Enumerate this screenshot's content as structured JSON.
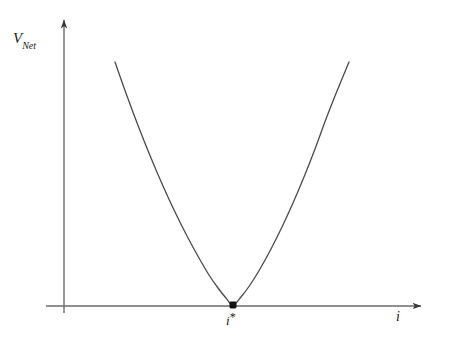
{
  "figure": {
    "background_color": "#ffffff",
    "ink_color": "#3a3a3a",
    "text_color": "#1a1a1a"
  },
  "labels": {
    "y_axis_main": "V",
    "y_axis_subscript": "Net",
    "x_axis": "i",
    "vertex_base": "i",
    "vertex_superscript": "*"
  },
  "chart_data": {
    "type": "line",
    "title": "",
    "xlabel": "i",
    "ylabel": "V_Net",
    "grid": false,
    "legend": null,
    "annotations": [
      {
        "name": "minimum-point",
        "label": "i*",
        "x_px": 233,
        "y_px": 305,
        "description": "marked minimum of the net voltage curve where the curve touches the horizontal axis"
      }
    ],
    "axes": {
      "origin_px": [
        64,
        306
      ],
      "x_axis_tip_px": [
        424,
        306
      ],
      "y_axis_tip_px": [
        64,
        17
      ],
      "x_axis_arrow": true,
      "y_axis_arrow": true,
      "ticks": []
    },
    "series": [
      {
        "name": "V_Net(i)",
        "shape": "parabola",
        "points_px": [
          [
            115,
            62
          ],
          [
            127,
            96
          ],
          [
            139,
            128
          ],
          [
            151,
            158
          ],
          [
            163,
            186
          ],
          [
            175,
            212
          ],
          [
            187,
            236
          ],
          [
            199,
            258
          ],
          [
            209,
            275
          ],
          [
            218,
            288
          ],
          [
            226,
            298
          ],
          [
            233,
            305
          ],
          [
            241,
            297
          ],
          [
            250,
            285
          ],
          [
            260,
            269
          ],
          [
            271,
            249
          ],
          [
            282,
            227
          ],
          [
            293,
            203
          ],
          [
            304,
            177
          ],
          [
            315,
            149
          ],
          [
            326,
            119
          ],
          [
            337,
            91
          ],
          [
            349,
            62
          ]
        ]
      }
    ]
  }
}
